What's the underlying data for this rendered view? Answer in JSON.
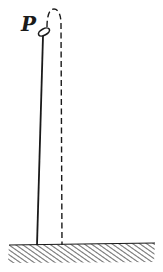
{
  "diagram": {
    "point_label": "P",
    "elements": {
      "tower": "solid vertical line from point P to the ground",
      "ball": "small tilted ellipse at point P",
      "trajectory": "dashed path rising from P, arcing over and falling to the ground",
      "ground": "hatched horizontal ground surface"
    },
    "colors": {
      "ink": "#1a1a1a",
      "hatch": "#555555",
      "background": "#ffffff"
    }
  }
}
